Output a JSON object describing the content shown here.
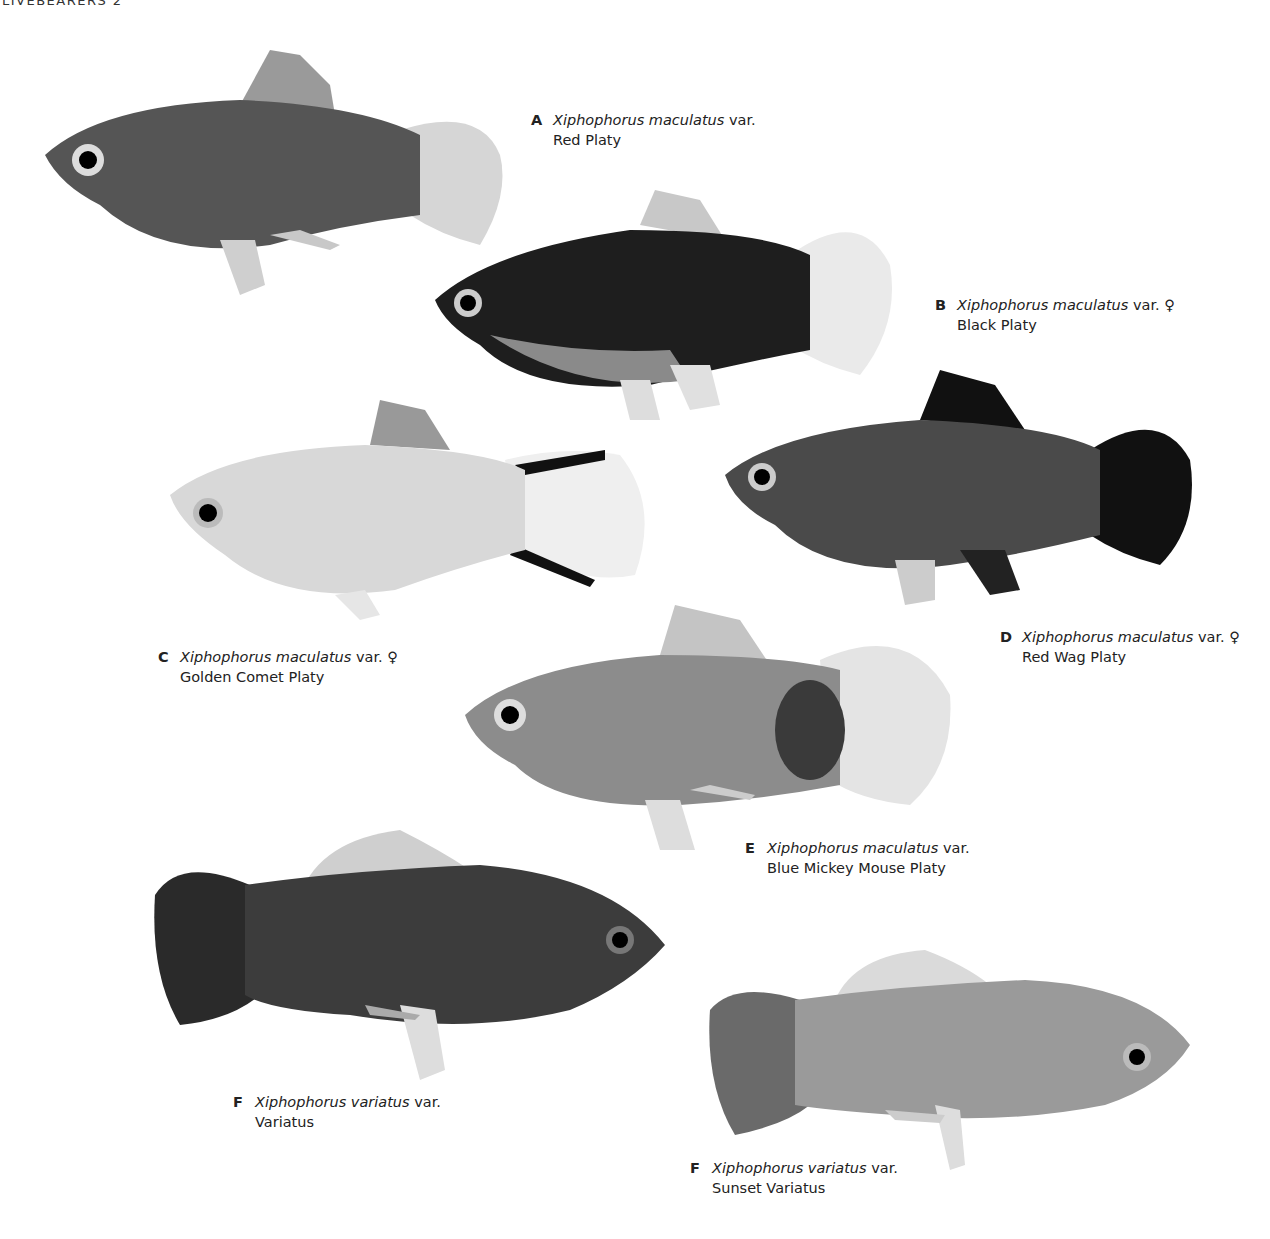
{
  "page": {
    "running_head": "LIVEBEARERS 2"
  },
  "plates": [
    {
      "letter": "A",
      "genus": "Xiphophorus maculatus",
      "var": "var.",
      "sex": "",
      "common": "Red Platy",
      "tone": "#555555",
      "fin": "#9a9a9a"
    },
    {
      "letter": "B",
      "genus": "Xiphophorus maculatus",
      "var": "var.",
      "sex": "♀",
      "common": "Black Platy",
      "tone": "#1e1e1e",
      "fin": "#e6e6e6"
    },
    {
      "letter": "C",
      "genus": "Xiphophorus maculatus",
      "var": "var.",
      "sex": "♀",
      "common": "Golden Comet Platy",
      "tone": "#d8d8d8",
      "fin": "#f2f2f2"
    },
    {
      "letter": "D",
      "genus": "Xiphophorus maculatus",
      "var": "var.",
      "sex": "♀",
      "common": "Red Wag Platy",
      "tone": "#4a4a4a",
      "fin": "#111111"
    },
    {
      "letter": "E",
      "genus": "Xiphophorus maculatus",
      "var": "var.",
      "sex": "",
      "common": "Blue Mickey Mouse Platy",
      "tone": "#8c8c8c",
      "fin": "#dcdcdc"
    },
    {
      "letter": "F",
      "genus": "Xiphophorus variatus",
      "var": "var.",
      "sex": "",
      "common": "Variatus",
      "tone": "#3c3c3c",
      "fin": "#2a2a2a"
    },
    {
      "letter": "F",
      "genus": "Xiphophorus variatus",
      "var": "var.",
      "sex": "",
      "common": "Sunset Variatus",
      "tone": "#9a9a9a",
      "fin": "#6a6a6a"
    }
  ]
}
